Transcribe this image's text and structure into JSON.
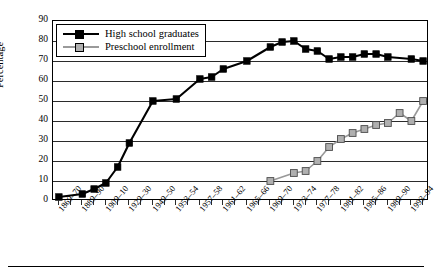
{
  "chart_data": {
    "type": "line",
    "title": "",
    "xlabel": "",
    "ylabel": "Percentage",
    "ylim": [
      0,
      90
    ],
    "ytick_step": 10,
    "yticks": [
      90,
      80,
      70,
      60,
      50,
      40,
      30,
      20,
      10,
      0
    ],
    "grid": true,
    "legend_position": "top-left",
    "categories": [
      "1869–70",
      "1889–90",
      "1909–10",
      "1929–30",
      "1949–50",
      "1953–54",
      "1957–58",
      "1961–62",
      "1965–66",
      "1969–70",
      "1973–74",
      "1977–78",
      "1981–82",
      "1985–86",
      "1989–90",
      "1993–94"
    ],
    "x_all_points": [
      "1869-70",
      "1879-80",
      "1889-90",
      "1899-1900",
      "1909-10",
      "1919-20",
      "1929-30",
      "1939-40",
      "1949-50",
      "1951-52",
      "1953-54",
      "1955-56",
      "1957-58",
      "1959-60",
      "1961-62",
      "1963-64",
      "1965-66",
      "1967-68",
      "1969-70",
      "1971-72",
      "1973-74",
      "1975-76",
      "1977-78",
      "1979-80",
      "1981-82",
      "1983-84",
      "1985-86",
      "1987-88",
      "1989-90",
      "1991-92",
      "1993-94",
      "1995-96"
    ],
    "series": [
      {
        "name": "High school graduates",
        "color": "#000000",
        "marker": "filled-square",
        "points": [
          {
            "x": 0,
            "y": 2
          },
          {
            "x": 2,
            "y": 3.5
          },
          {
            "x": 3,
            "y": 6
          },
          {
            "x": 4,
            "y": 9
          },
          {
            "x": 5,
            "y": 17
          },
          {
            "x": 6,
            "y": 29
          },
          {
            "x": 8,
            "y": 50
          },
          {
            "x": 10,
            "y": 51
          },
          {
            "x": 12,
            "y": 61
          },
          {
            "x": 13,
            "y": 62
          },
          {
            "x": 14,
            "y": 66
          },
          {
            "x": 16,
            "y": 70
          },
          {
            "x": 18,
            "y": 77
          },
          {
            "x": 19,
            "y": 79.5
          },
          {
            "x": 20,
            "y": 80
          },
          {
            "x": 21,
            "y": 76
          },
          {
            "x": 22,
            "y": 75
          },
          {
            "x": 23,
            "y": 71
          },
          {
            "x": 24,
            "y": 72
          },
          {
            "x": 25,
            "y": 72
          },
          {
            "x": 26,
            "y": 73.5
          },
          {
            "x": 27,
            "y": 73.5
          },
          {
            "x": 28,
            "y": 72
          },
          {
            "x": 30,
            "y": 71
          },
          {
            "x": 31,
            "y": 70
          }
        ]
      },
      {
        "name": "Preschool enrollment",
        "color": "#999999",
        "marker": "open-square",
        "points": [
          {
            "x": 18,
            "y": 10
          },
          {
            "x": 20,
            "y": 14
          },
          {
            "x": 21,
            "y": 15
          },
          {
            "x": 22,
            "y": 20
          },
          {
            "x": 23,
            "y": 27
          },
          {
            "x": 24,
            "y": 31
          },
          {
            "x": 25,
            "y": 34
          },
          {
            "x": 26,
            "y": 36
          },
          {
            "x": 27,
            "y": 38
          },
          {
            "x": 28,
            "y": 39
          },
          {
            "x": 29,
            "y": 44
          },
          {
            "x": 30,
            "y": 40
          },
          {
            "x": 31,
            "y": 50
          }
        ]
      }
    ]
  },
  "legend": {
    "items": [
      {
        "label": "High school graduates",
        "color": "#000000",
        "marker": "filled-square"
      },
      {
        "label": "Preschool enrollment",
        "color": "#999999",
        "marker": "open-square"
      }
    ]
  }
}
